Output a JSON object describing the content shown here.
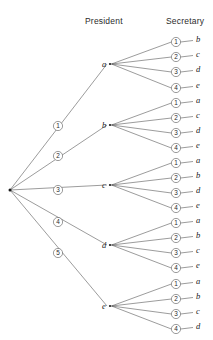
{
  "diagram": {
    "type": "probability-tree",
    "title": "",
    "columns": [
      {
        "id": "president",
        "label": "President",
        "x": 110,
        "header_x": 85,
        "header_y": 16
      },
      {
        "id": "secretary",
        "label": "Secretary",
        "x": 198,
        "header_x": 166,
        "header_y": 16
      }
    ],
    "root": {
      "name": "root-node",
      "x": 10,
      "y": 190
    },
    "level1_branch_labels": [
      "1",
      "2",
      "3",
      "4",
      "5"
    ],
    "level2_branch_labels": [
      "1",
      "2",
      "3",
      "4"
    ],
    "branches": [
      {
        "branch_label": "1",
        "branch_label_x": 58,
        "branch_label_y": 126,
        "president": "a",
        "president_x": 110,
        "president_y": 64,
        "secretaries": [
          {
            "label": "1",
            "letter": "b",
            "y": 42
          },
          {
            "label": "2",
            "letter": "c",
            "y": 57
          },
          {
            "label": "3",
            "letter": "d",
            "y": 72
          },
          {
            "label": "4",
            "letter": "e",
            "y": 88
          }
        ]
      },
      {
        "branch_label": "2",
        "branch_label_x": 58,
        "branch_label_y": 156,
        "president": "b",
        "president_x": 110,
        "president_y": 125,
        "secretaries": [
          {
            "label": "1",
            "letter": "a",
            "y": 103
          },
          {
            "label": "2",
            "letter": "c",
            "y": 118
          },
          {
            "label": "3",
            "letter": "d",
            "y": 133
          },
          {
            "label": "4",
            "letter": "e",
            "y": 148
          }
        ]
      },
      {
        "branch_label": "3",
        "branch_label_x": 58,
        "branch_label_y": 190,
        "president": "c",
        "president_x": 110,
        "president_y": 185,
        "secretaries": [
          {
            "label": "1",
            "letter": "a",
            "y": 163
          },
          {
            "label": "2",
            "letter": "b",
            "y": 178
          },
          {
            "label": "3",
            "letter": "d",
            "y": 193
          },
          {
            "label": "4",
            "letter": "e",
            "y": 208
          }
        ]
      },
      {
        "branch_label": "4",
        "branch_label_x": 58,
        "branch_label_y": 222,
        "president": "d",
        "president_x": 110,
        "president_y": 245,
        "secretaries": [
          {
            "label": "1",
            "letter": "a",
            "y": 223
          },
          {
            "label": "2",
            "letter": "b",
            "y": 238
          },
          {
            "label": "3",
            "letter": "c",
            "y": 253
          },
          {
            "label": "4",
            "letter": "e",
            "y": 268
          }
        ]
      },
      {
        "branch_label": "5",
        "branch_label_x": 58,
        "branch_label_y": 253,
        "president": "e",
        "president_x": 110,
        "president_y": 306,
        "secretaries": [
          {
            "label": "1",
            "letter": "a",
            "y": 284
          },
          {
            "label": "2",
            "letter": "b",
            "y": 299
          },
          {
            "label": "3",
            "letter": "c",
            "y": 314
          },
          {
            "label": "4",
            "letter": "d",
            "y": 329
          }
        ]
      }
    ],
    "geometry": {
      "secretary_circle_x": 176,
      "secretary_letter_x": 198,
      "circle_radius": 4.6,
      "stroke_color": "#4a4a4a",
      "text_color": "#1a1a1a",
      "background": "#ffffff"
    }
  }
}
